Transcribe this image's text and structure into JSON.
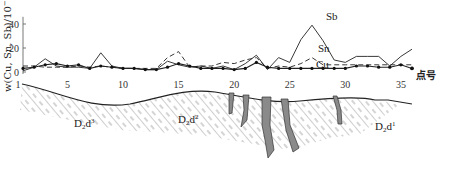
{
  "chart_data": {
    "type": "line",
    "title": "",
    "xlabel": "点号",
    "ylabel": "w(Cu, Sn, Sb)/10⁻⁶",
    "ylim": [
      0,
      45
    ],
    "xlim": [
      1,
      36
    ],
    "yticks": [
      0,
      20,
      40
    ],
    "xticks": [
      1,
      5,
      10,
      15,
      20,
      25,
      30,
      35
    ],
    "grid": false,
    "legend": "inline labels next to lines (Sb, Sn, Cu)",
    "x": [
      1,
      2,
      3,
      4,
      5,
      6,
      7,
      8,
      9,
      10,
      11,
      12,
      13,
      14,
      15,
      16,
      17,
      18,
      19,
      20,
      21,
      22,
      23,
      24,
      25,
      26,
      27,
      28,
      29,
      30,
      31,
      32,
      33,
      34,
      35,
      36
    ],
    "series": [
      {
        "name": "Sb",
        "style": "solid",
        "values": [
          1,
          4,
          11,
          5,
          4,
          4,
          3,
          16,
          5,
          3,
          3,
          2,
          2,
          9,
          6,
          4,
          5,
          3,
          5,
          2,
          7,
          14,
          2,
          12,
          8,
          27,
          39,
          26,
          10,
          8,
          13,
          13,
          13,
          5,
          13,
          19
        ]
      },
      {
        "name": "Sn",
        "style": "dashed",
        "values": [
          5,
          5,
          4,
          4,
          4,
          5,
          4,
          5,
          4,
          3,
          3,
          3,
          3,
          12,
          17,
          4,
          5,
          5,
          8,
          7,
          10,
          12,
          3,
          5,
          4,
          7,
          12,
          6,
          6,
          6,
          6,
          6,
          6,
          6,
          6,
          6
        ]
      },
      {
        "name": "Cu",
        "style": "solid with dot markers",
        "values": [
          3,
          4,
          6,
          7,
          5,
          6,
          3,
          5,
          4,
          3,
          3,
          2,
          2,
          4,
          7,
          5,
          3,
          3,
          3,
          2,
          3,
          8,
          4,
          3,
          3,
          3,
          3,
          3,
          3,
          3,
          5,
          5,
          4,
          4,
          6,
          3
        ]
      }
    ],
    "annotations": [
      {
        "text": "Sb",
        "near_x": 27,
        "near_y": 42
      },
      {
        "text": "Sn",
        "near_x": 26,
        "near_y": 17
      },
      {
        "text": "Cu",
        "near_x": 26,
        "near_y": 9
      }
    ],
    "cross_section": {
      "formations": [
        "D₂d³",
        "D₂d²",
        "D₂d¹"
      ],
      "veins_count": 5,
      "description": "Geological section below the profile: hatched strata with gray ore veins near points 18–30"
    }
  },
  "labels": {
    "y_axis": "w(Cu, Sn, Sb)/10",
    "y_axis_exp": "−6",
    "x_axis": "点号",
    "sb": "Sb",
    "sn": "Sn",
    "cu": "Cu",
    "f3_main": "D",
    "f3_sub": "2",
    "f3_d": "d",
    "f3_sup": "3",
    "f2_main": "D",
    "f2_sub": "2",
    "f2_d": "d",
    "f2_sup": "2",
    "f1_main": "D",
    "f1_sub": "2",
    "f1_d": "d",
    "f1_sup": "1"
  }
}
